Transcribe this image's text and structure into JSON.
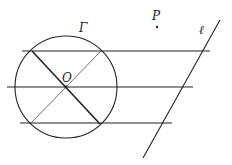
{
  "diagram": {
    "labels": {
      "circle": "Γ",
      "center": "O",
      "point": "P",
      "line": "ℓ"
    },
    "circle": {
      "cx": 66,
      "cy": 87,
      "r": 51
    },
    "center_point": {
      "x": 66,
      "y": 87
    },
    "point_P": {
      "x": 157,
      "y": 27
    },
    "line_l": {
      "x1": 220,
      "y1": 20,
      "x2": 143,
      "y2": 158
    },
    "parallel_lines": [
      {
        "x1": 22,
        "y1": 51,
        "x2": 210,
        "y2": 51
      },
      {
        "x1": 7,
        "y1": 87,
        "x2": 193,
        "y2": 87
      },
      {
        "x1": 20,
        "y1": 123,
        "x2": 172,
        "y2": 123
      }
    ],
    "diagonals": [
      {
        "x1": 32,
        "y1": 51,
        "x2": 100,
        "y2": 124,
        "weight": "thick"
      },
      {
        "x1": 101,
        "y1": 51,
        "x2": 31,
        "y2": 123,
        "weight": "thin"
      }
    ],
    "colors": {
      "stroke": "#222222",
      "background": "#ffffff"
    }
  }
}
